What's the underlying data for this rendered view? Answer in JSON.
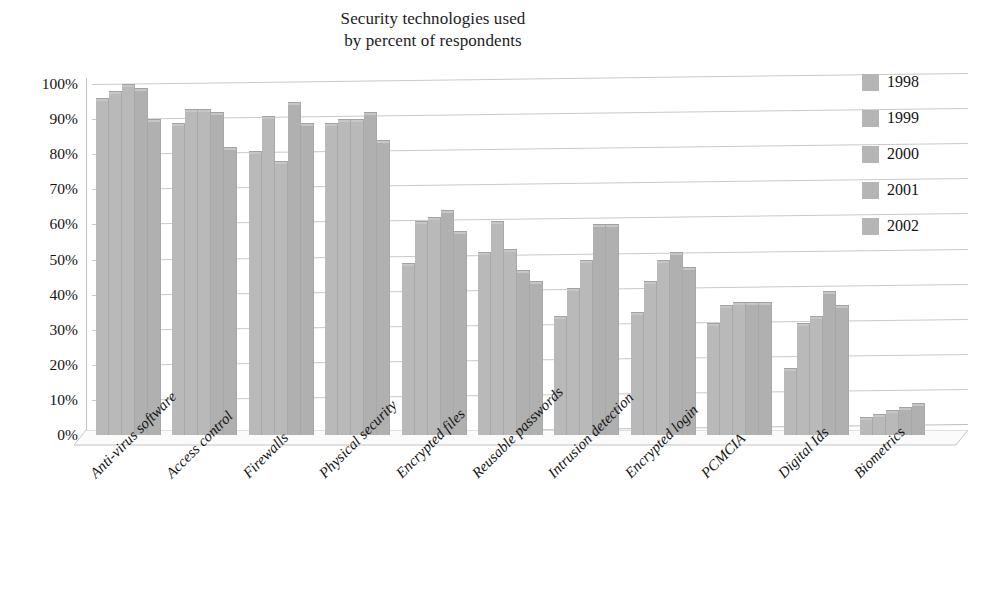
{
  "chart_data": {
    "type": "bar",
    "title": "Security technologies used by percent of respondents",
    "title_lines": [
      "Security technologies used",
      "by percent of respondents"
    ],
    "xlabel": "",
    "ylabel": "",
    "ylim": [
      0,
      100
    ],
    "ytick_labels": [
      "100%",
      "90%",
      "80%",
      "70%",
      "60%",
      "50%",
      "40%",
      "30%",
      "20%",
      "10%",
      "0%"
    ],
    "ytick_values": [
      100,
      90,
      80,
      70,
      60,
      50,
      40,
      30,
      20,
      10,
      0
    ],
    "grid": true,
    "legend_position": "right",
    "bar_color": "#b9b9b9",
    "gridline_color": "#c9c9c9",
    "text_color": "#141414",
    "categories": [
      "Anti-virus software",
      "Access control",
      "Firewalls",
      "Physical security",
      "Encrypted files",
      "Reusable passwords",
      "Intrusion detection",
      "Encrypted login",
      "PCMCIA",
      "Digital Ids",
      "Biometrics"
    ],
    "series": [
      {
        "name": "1998",
        "values": [
          96,
          89,
          81,
          89,
          49,
          52,
          34,
          35,
          32,
          19,
          5
        ]
      },
      {
        "name": "1999",
        "values": [
          98,
          93,
          91,
          90,
          61,
          61,
          42,
          44,
          37,
          32,
          6
        ]
      },
      {
        "name": "2000",
        "values": [
          100,
          93,
          78,
          90,
          62,
          53,
          50,
          50,
          38,
          34,
          7
        ]
      },
      {
        "name": "2001",
        "values": [
          99,
          92,
          95,
          92,
          64,
          47,
          60,
          52,
          38,
          41,
          8
        ]
      },
      {
        "name": "2002",
        "values": [
          90,
          82,
          89,
          84,
          58,
          44,
          60,
          48,
          38,
          37,
          9
        ]
      }
    ]
  },
  "legend": {
    "items": [
      {
        "label": "1998",
        "color": "#b5b5b5"
      },
      {
        "label": "1999",
        "color": "#b5b5b5"
      },
      {
        "label": "2000",
        "color": "#b5b5b5"
      },
      {
        "label": "2001",
        "color": "#b5b5b5"
      },
      {
        "label": "2002",
        "color": "#b5b5b5"
      }
    ]
  }
}
